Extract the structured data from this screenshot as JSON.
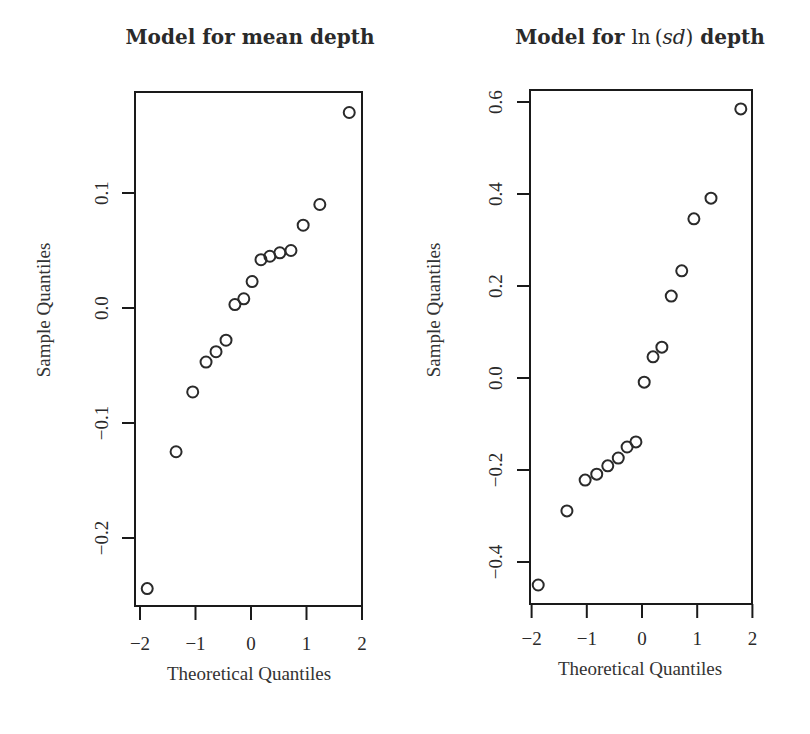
{
  "figure": {
    "panels": [
      {
        "title_parts": [
          {
            "text": "Model for mean depth",
            "style": "bold"
          }
        ],
        "xlabel": "Theoretical Quantiles",
        "ylabel": "Sample Quantiles"
      },
      {
        "title_parts": [
          {
            "text": "Model for ",
            "style": "bold"
          },
          {
            "text": "ln",
            "style": "normal"
          },
          {
            "text": " (",
            "style": "normal"
          },
          {
            "text": "sd",
            "style": "italic"
          },
          {
            "text": ")",
            "style": "normal"
          },
          {
            "text": " depth",
            "style": "bold"
          }
        ],
        "xlabel": "Theoretical Quantiles",
        "ylabel": "Sample Quantiles"
      }
    ]
  },
  "chart_data": [
    {
      "type": "scatter",
      "title": "Model for mean depth",
      "xlabel": "Theoretical Quantiles",
      "ylabel": "Sample Quantiles",
      "xlim": [
        -2.0,
        2.0
      ],
      "ylim": [
        -0.255,
        0.19
      ],
      "xticks": [
        -2,
        -1,
        0,
        1,
        2
      ],
      "xtick_labels": [
        "−2",
        "−1",
        "0",
        "1",
        "2"
      ],
      "yticks": [
        -0.2,
        -0.1,
        0.0,
        0.1
      ],
      "ytick_labels": [
        "−0.2",
        "−0.1",
        "0.0",
        "0.1"
      ],
      "grid": false,
      "marker": "open-circle",
      "x": [
        -1.87,
        -1.35,
        -1.05,
        -0.81,
        -0.63,
        -0.45,
        -0.29,
        -0.13,
        0.02,
        0.18,
        0.34,
        0.52,
        0.72,
        0.94,
        1.24,
        1.77
      ],
      "y": [
        -0.244,
        -0.125,
        -0.073,
        -0.047,
        -0.038,
        -0.028,
        0.003,
        0.008,
        0.023,
        0.042,
        0.045,
        0.048,
        0.05,
        0.072,
        0.09,
        0.17
      ]
    },
    {
      "type": "scatter",
      "title": "Model for ln(sd) depth",
      "xlabel": "Theoretical Quantiles",
      "ylabel": "Sample Quantiles",
      "xlim": [
        -2.0,
        2.0
      ],
      "ylim": [
        -0.49,
        0.62
      ],
      "xticks": [
        -2,
        -1,
        0,
        1,
        2
      ],
      "xtick_labels": [
        "−2",
        "−1",
        "0",
        "1",
        "2"
      ],
      "yticks": [
        -0.4,
        -0.2,
        0.0,
        0.2,
        0.4,
        0.6
      ],
      "ytick_labels": [
        "−0.4",
        "−0.2",
        "0.0",
        "0.2",
        "0.4",
        "0.6"
      ],
      "grid": false,
      "marker": "open-circle",
      "x": [
        -1.88,
        -1.36,
        -1.03,
        -0.82,
        -0.62,
        -0.43,
        -0.27,
        -0.11,
        0.04,
        0.2,
        0.36,
        0.53,
        0.72,
        0.94,
        1.25,
        1.79
      ],
      "y": [
        -0.45,
        -0.289,
        -0.222,
        -0.209,
        -0.191,
        -0.174,
        -0.15,
        -0.139,
        -0.009,
        0.046,
        0.067,
        0.178,
        0.233,
        0.346,
        0.391,
        0.585
      ]
    }
  ]
}
